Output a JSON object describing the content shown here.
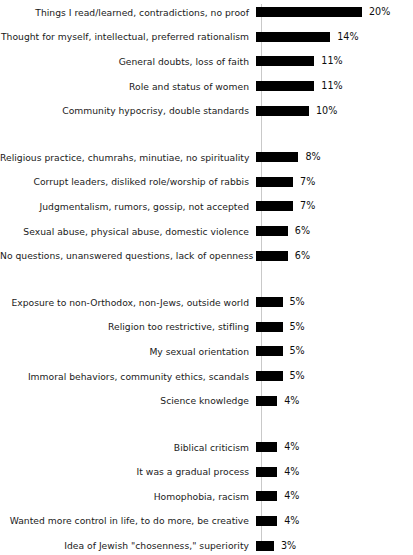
{
  "chart_data": {
    "type": "bar",
    "orientation": "horizontal",
    "title": "",
    "subtitle": "",
    "xlabel": "",
    "ylabel": "",
    "grid": false,
    "legend": null,
    "value_suffix": "%",
    "xlim": [
      0,
      20
    ],
    "axis_line_color": "#c9c9c9",
    "bar_color": "#000000",
    "categories": [
      "Things I read/learned, contradictions, no proof",
      "Thought for myself, intellectual, preferred rationalism",
      "General doubts, loss of faith",
      "Role and status of women",
      "Community hypocrisy, double standards",
      "Religious practice, chumrahs, minutiae, no spirituality",
      "Corrupt leaders, disliked role/worship of rabbis",
      "Judgmentalism, rumors, gossip, not accepted",
      "Sexual abuse, physical abuse, domestic violence",
      "No questions, unanswered questions, lack of openness",
      "Exposure to non-Orthodox, non-Jews, outside world",
      "Religion too restrictive, stifling",
      "My sexual orientation",
      "Immoral behaviors, community ethics, scandals",
      "Science knowledge",
      "Biblical criticism",
      "It was a gradual process",
      "Homophobia, racism",
      "Wanted more control in life, to do more, be creative",
      "Idea of Jewish \"chosenness,\" superiority"
    ],
    "values": [
      20,
      14,
      11,
      11,
      10,
      8,
      7,
      7,
      6,
      6,
      5,
      5,
      5,
      5,
      4,
      4,
      4,
      4,
      4,
      3
    ],
    "value_labels": [
      "20%",
      "14%",
      "11%",
      "11%",
      "10%",
      "8%",
      "7%",
      "7%",
      "6%",
      "6%",
      "5%",
      "5%",
      "5%",
      "5%",
      "4%",
      "4%",
      "4%",
      "4%",
      "4%",
      "3%"
    ],
    "groups": [
      {
        "name": "group-1",
        "rows": [
          {
            "label": "Things I read/learned, contradictions, no proof",
            "value": 20,
            "value_label": "20%"
          },
          {
            "label": "Thought for myself, intellectual, preferred rationalism",
            "value": 14,
            "value_label": "14%"
          },
          {
            "label": "General doubts, loss of faith",
            "value": 11,
            "value_label": "11%"
          },
          {
            "label": "Role and status of women",
            "value": 11,
            "value_label": "11%"
          },
          {
            "label": "Community hypocrisy, double standards",
            "value": 10,
            "value_label": "10%"
          }
        ]
      },
      {
        "name": "group-2",
        "rows": [
          {
            "label": "Religious practice, chumrahs, minutiae, no spirituality",
            "value": 8,
            "value_label": "8%"
          },
          {
            "label": "Corrupt leaders, disliked role/worship of rabbis",
            "value": 7,
            "value_label": "7%"
          },
          {
            "label": "Judgmentalism, rumors, gossip, not accepted",
            "value": 7,
            "value_label": "7%"
          },
          {
            "label": "Sexual abuse, physical abuse, domestic violence",
            "value": 6,
            "value_label": "6%"
          },
          {
            "label": "No questions, unanswered questions, lack of openness",
            "value": 6,
            "value_label": "6%"
          }
        ]
      },
      {
        "name": "group-3",
        "rows": [
          {
            "label": "Exposure to non-Orthodox, non-Jews, outside world",
            "value": 5,
            "value_label": "5%"
          },
          {
            "label": "Religion too restrictive, stifling",
            "value": 5,
            "value_label": "5%"
          },
          {
            "label": "My sexual orientation",
            "value": 5,
            "value_label": "5%"
          },
          {
            "label": "Immoral behaviors, community ethics, scandals",
            "value": 5,
            "value_label": "5%"
          },
          {
            "label": "Science knowledge",
            "value": 4,
            "value_label": "4%"
          }
        ]
      },
      {
        "name": "group-4",
        "rows": [
          {
            "label": "Biblical criticism",
            "value": 4,
            "value_label": "4%"
          },
          {
            "label": "It was a gradual process",
            "value": 4,
            "value_label": "4%"
          },
          {
            "label": "Homophobia, racism",
            "value": 4,
            "value_label": "4%"
          },
          {
            "label": "Wanted more control in life, to do more, be creative",
            "value": 4,
            "value_label": "4%"
          },
          {
            "label": "Idea of Jewish \"chosenness,\" superiority",
            "value": 3,
            "value_label": "3%"
          }
        ]
      }
    ]
  },
  "render": {
    "px_per_percent": 5.3,
    "bar_min_width_px": 18
  }
}
